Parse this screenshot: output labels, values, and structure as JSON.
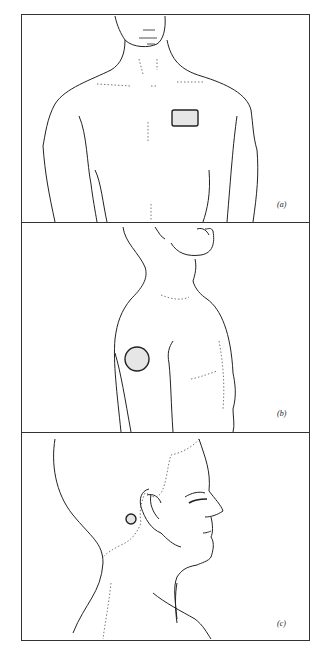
{
  "figure": {
    "panels": [
      {
        "id": "a",
        "label": "(a)",
        "view": "front torso",
        "marker": "rectangle"
      },
      {
        "id": "b",
        "label": "(b)",
        "view": "side torso",
        "marker": "circle"
      },
      {
        "id": "c",
        "label": "(c)",
        "view": "head profile",
        "marker": "small circle behind ear"
      }
    ],
    "colors": {
      "line": "#222222",
      "marker_fill": "#e6e6e6",
      "background": "#ffffff"
    }
  }
}
